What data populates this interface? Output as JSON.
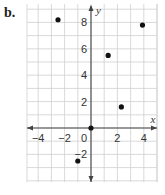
{
  "part_label": "b.",
  "chart_data": {
    "type": "scatter",
    "title": "",
    "xlabel": "x",
    "ylabel": "y",
    "xlim": [
      -4.8,
      5.0
    ],
    "ylim": [
      -4.2,
      9.4
    ],
    "grid": true,
    "grid_step": 1,
    "x_ticks": [
      -4,
      -2,
      2,
      4
    ],
    "y_ticks": [
      -2,
      2,
      4,
      6,
      8
    ],
    "origin_label": "0",
    "points": [
      {
        "x": -2.5,
        "y": 8.2
      },
      {
        "x": 1.3,
        "y": 5.5
      },
      {
        "x": 3.9,
        "y": 7.8
      },
      {
        "x": 2.3,
        "y": 1.6
      },
      {
        "x": 0,
        "y": 0
      },
      {
        "x": -1.0,
        "y": -2.5
      }
    ],
    "colors": {
      "grid": "#cfcfcf",
      "axis": "#444444",
      "point": "#111111",
      "text": "#333333"
    }
  }
}
